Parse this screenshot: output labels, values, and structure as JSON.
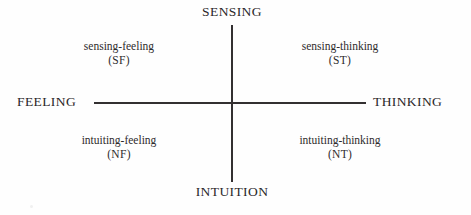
{
  "figure": {
    "background_color": "#fefefe",
    "ink_color": "#333031",
    "poles": {
      "top": "SENSING",
      "bottom": "INTUITION",
      "left": "FEELING",
      "right": "THINKING"
    },
    "quadrants": [
      {
        "position": "top-left",
        "name": "sensing-feeling",
        "abbr": "(SF)"
      },
      {
        "position": "top-right",
        "name": "sensing-thinking",
        "abbr": "(ST)"
      },
      {
        "position": "bottom-left",
        "name": "intuiting-feeling",
        "abbr": "(NF)"
      },
      {
        "position": "bottom-right",
        "name": "intuiting-thinking",
        "abbr": "(NT)"
      }
    ]
  },
  "chart_data": {
    "type": "scatter",
    "title": "",
    "xlabel": "",
    "ylabel": "",
    "grid": false,
    "legend": "none",
    "axes": {
      "horizontal": {
        "left_pole": "FEELING",
        "right_pole": "THINKING"
      },
      "vertical": {
        "top_pole": "SENSING",
        "bottom_pole": "INTUITION"
      }
    },
    "categories": [
      "sensing-feeling",
      "sensing-thinking",
      "intuiting-feeling",
      "intuiting-thinking"
    ],
    "series": [
      {
        "name": "cognitive function pairs",
        "points": [
          {
            "label": "sensing-feeling",
            "abbr": "SF",
            "x": -1,
            "y": 1
          },
          {
            "label": "sensing-thinking",
            "abbr": "ST",
            "x": 1,
            "y": 1
          },
          {
            "label": "intuiting-feeling",
            "abbr": "NF",
            "x": -1,
            "y": -1
          },
          {
            "label": "intuiting-thinking",
            "abbr": "NT",
            "x": 1,
            "y": -1
          }
        ]
      }
    ],
    "xlim": [
      -1,
      1
    ],
    "ylim": [
      -1,
      1
    ]
  }
}
